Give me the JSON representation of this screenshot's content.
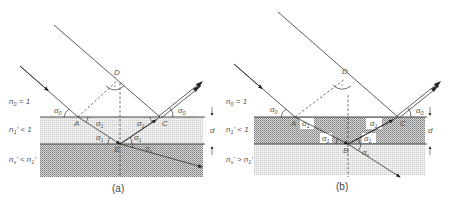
{
  "figure": {
    "panels": [
      {
        "id": "a",
        "caption": "(a)",
        "media_labels": {
          "n0": "n",
          "n0_sub": "0",
          "n0_rel": " = 1",
          "n1": "n",
          "n1_sub": "1",
          "n1_rel": "' < 1",
          "ns": "n",
          "ns_sub": "s",
          "ns_rel": "' < n",
          "ns_rel_sub": "1",
          "ns_rel_end": "'"
        },
        "points": {
          "A": "A",
          "B": "B",
          "C": "C",
          "D": "D"
        },
        "angles": {
          "alpha0_left": "α",
          "alpha0_left_sub": "0",
          "alpha0_right": "α",
          "alpha0_right_sub": "0",
          "alpha1": "α",
          "alpha1_sub": "1",
          "alphas": "α",
          "alphas_sub": "s"
        },
        "thickness_label": "d",
        "film_shading": "light",
        "substrate_shading": "dark"
      },
      {
        "id": "b",
        "caption": "(b)",
        "media_labels": {
          "n0": "n",
          "n0_sub": "0",
          "n0_rel": " = 1",
          "n1": "n",
          "n1_sub": "1",
          "n1_rel": "' < 1",
          "ns": "n",
          "ns_sub": "s",
          "ns_rel": "' > n",
          "ns_rel_sub": "1",
          "ns_rel_end": "'"
        },
        "points": {
          "A": "A",
          "B": "B",
          "C": "C",
          "D": "D"
        },
        "angles": {
          "alpha0_left": "α",
          "alpha0_left_sub": "0",
          "alpha0_right": "α",
          "alpha0_right_sub": "0",
          "alpha1": "α",
          "alpha1_sub": "1",
          "alphas": "α",
          "alphas_sub": "s"
        },
        "thickness_label": "d",
        "film_shading": "dark",
        "substrate_shading": "light"
      }
    ],
    "colors": {
      "line": "#333333",
      "light_fill": "#e6e6e6",
      "dark_fill": "#b5b5b5",
      "text": "#555555"
    }
  }
}
